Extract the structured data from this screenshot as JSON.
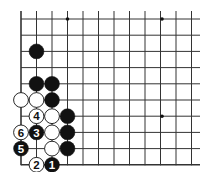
{
  "diagram": {
    "title": "",
    "grid": {
      "origin_x": 21,
      "origin_y": 19,
      "dx": 15.5,
      "dy": 16.2,
      "cols": 12,
      "rows": 10,
      "right_edge_x": 200,
      "left_edge": true,
      "bottom_edge": true,
      "line_color": "#333333"
    },
    "star_points": [
      {
        "col": 3,
        "row": 0
      },
      {
        "col": 9,
        "row": 0
      },
      {
        "col": 9,
        "row": 6
      }
    ],
    "stones": [
      {
        "color": "black",
        "col": 1,
        "row": 2,
        "label": ""
      },
      {
        "color": "black",
        "col": 1,
        "row": 4,
        "label": ""
      },
      {
        "color": "black",
        "col": 2,
        "row": 4,
        "label": ""
      },
      {
        "color": "white",
        "col": 0,
        "row": 5,
        "label": ""
      },
      {
        "color": "white",
        "col": 1,
        "row": 5,
        "label": ""
      },
      {
        "color": "black",
        "col": 2,
        "row": 5,
        "label": ""
      },
      {
        "color": "white",
        "col": 1,
        "row": 6,
        "label": "4"
      },
      {
        "color": "white",
        "col": 2,
        "row": 6,
        "label": ""
      },
      {
        "color": "black",
        "col": 3,
        "row": 6,
        "label": ""
      },
      {
        "color": "white",
        "col": 0,
        "row": 7,
        "label": "6"
      },
      {
        "color": "black",
        "col": 1,
        "row": 7,
        "label": "3"
      },
      {
        "color": "white",
        "col": 2,
        "row": 7,
        "label": ""
      },
      {
        "color": "black",
        "col": 3,
        "row": 7,
        "label": ""
      },
      {
        "color": "black",
        "col": 0,
        "row": 8,
        "label": "5"
      },
      {
        "color": "white",
        "col": 2,
        "row": 8,
        "label": ""
      },
      {
        "color": "black",
        "col": 3,
        "row": 8,
        "label": ""
      },
      {
        "color": "white",
        "col": 1,
        "row": 9,
        "label": "2"
      },
      {
        "color": "black",
        "col": 2,
        "row": 9,
        "label": "1"
      }
    ]
  }
}
